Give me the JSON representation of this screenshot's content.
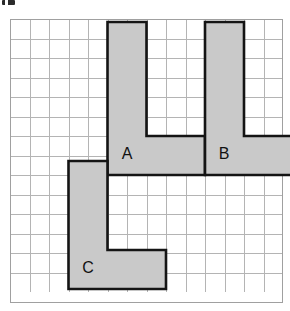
{
  "figure": {
    "corner_mark_name": "clipped-label-artifact"
  },
  "grid": {
    "columns": 14,
    "rows": 14,
    "cell_size_px": 19.5,
    "line_color": "#b4b4b4",
    "border_color": "#a0a0a0",
    "background_color": "#ffffff"
  },
  "style": {
    "shape_fill": "#c9c9c9",
    "shape_stroke": "#141414",
    "label_color": "#111111"
  },
  "shapes": [
    {
      "label": "A",
      "name": "l-shape-a",
      "points": "97.5,3 136.5,3 136.5,117 195,117 195,156 97.5,156",
      "label_x": 117,
      "label_y": 136,
      "grid_cells": 7,
      "arm_height_cells": 6,
      "arm_width_cells": 2,
      "foot_width_cells": 5,
      "foot_height_cells": 2
    },
    {
      "label": "B",
      "name": "l-shape-b",
      "points": "195,3 234,3 234,117 292.5,117 292.5,156 195,156",
      "label_x": 214,
      "label_y": 136,
      "grid_cells": 7,
      "arm_height_cells": 6,
      "arm_width_cells": 2,
      "foot_width_cells": 5,
      "foot_height_cells": 2
    },
    {
      "label": "C",
      "name": "l-shape-c",
      "points": "58.5,142 97.5,142 97.5,231 156,231 156,270 58.5,270",
      "label_x": 78,
      "label_y": 250,
      "grid_cells": 7,
      "arm_height_cells": 6,
      "arm_width_cells": 2,
      "foot_width_cells": 5,
      "foot_height_cells": 2
    }
  ],
  "chart_data": {
    "type": "diagram",
    "grid_columns": 14,
    "grid_rows": 14,
    "shape_labels": [
      "A",
      "B",
      "C"
    ]
  }
}
